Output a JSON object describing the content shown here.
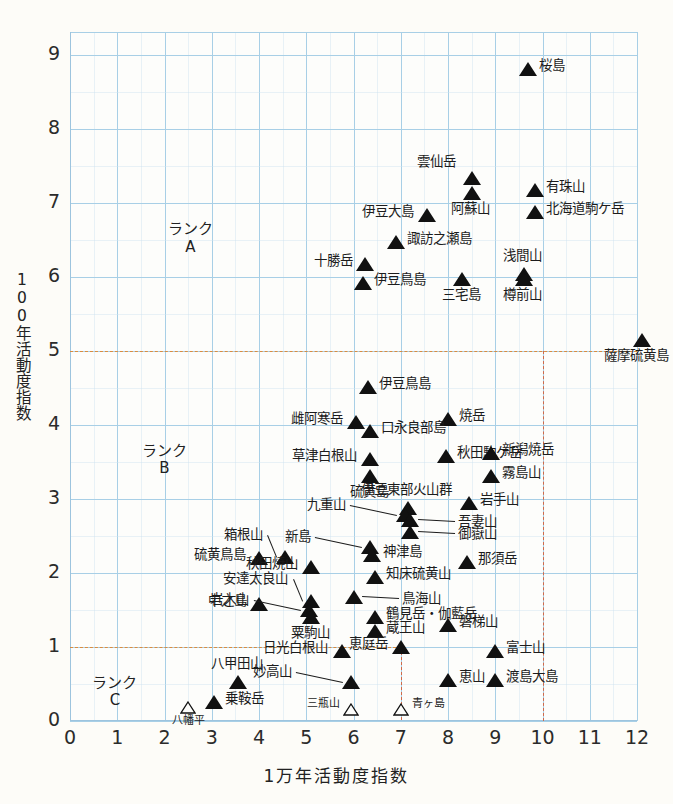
{
  "chart_data": {
    "type": "scatter",
    "title": "",
    "xlabel": "1万年活動度指数",
    "ylabel": "100年活動度指数",
    "xlim": [
      0,
      12.6
    ],
    "ylim": [
      0,
      9.4
    ],
    "xticks": [
      "0",
      "1",
      "2",
      "3",
      "4",
      "5",
      "6",
      "7",
      "8",
      "9",
      "10",
      "11",
      "12"
    ],
    "yticks": [
      "0",
      "1",
      "2",
      "3",
      "4",
      "5",
      "6",
      "7",
      "8",
      "9"
    ],
    "grid": true,
    "legend": "none",
    "rank_thresholds": {
      "rank_a_y": 5,
      "rank_b_y": 1,
      "rank_b_x": 7,
      "rank_c_x": 7,
      "line_color_horizontal": "#d98c40",
      "line_color_vertical": "#cf6a4a"
    },
    "annotations": [
      {
        "text": "ランク\nA",
        "x": 2.55,
        "y": 6.62
      },
      {
        "text": "ランク\nB",
        "x": 2.0,
        "y": 3.62
      },
      {
        "text": "ランク\nC",
        "x": 0.95,
        "y": 0.48
      }
    ],
    "marker_styles": {
      "filled": "filled-triangle",
      "open": "open-triangle"
    },
    "points": [
      {
        "name": "桜島",
        "x": 9.7,
        "y": 8.72,
        "marker": "filled",
        "label_pos": "right"
      },
      {
        "name": "雲仙岳",
        "x": 8.5,
        "y": 7.25,
        "marker": "filled",
        "label_pos": "upleft"
      },
      {
        "name": "阿蘇山",
        "x": 8.5,
        "y": 7.05,
        "marker": "filled",
        "label_pos": "below"
      },
      {
        "name": "有珠山",
        "x": 9.85,
        "y": 7.08,
        "marker": "filled",
        "label_pos": "right"
      },
      {
        "name": "北海道駒ケ岳",
        "x": 9.85,
        "y": 6.78,
        "marker": "filled",
        "label_pos": "right"
      },
      {
        "name": "伊豆大島",
        "x": 7.55,
        "y": 6.75,
        "marker": "filled",
        "label_pos": "left"
      },
      {
        "name": "諏訪之瀬島",
        "x": 6.9,
        "y": 6.38,
        "marker": "filled",
        "label_pos": "right"
      },
      {
        "name": "十勝岳",
        "x": 6.25,
        "y": 6.08,
        "marker": "filled",
        "label_pos": "left"
      },
      {
        "name": "浅間山",
        "x": 9.6,
        "y": 5.95,
        "marker": "filled",
        "label_pos": "above"
      },
      {
        "name": "伊豆鳥島",
        "x": 6.2,
        "y": 5.82,
        "marker": "filled",
        "label_pos": "right"
      },
      {
        "name": "三宅島",
        "x": 8.3,
        "y": 5.88,
        "marker": "filled",
        "label_pos": "below"
      },
      {
        "name": "樽前山",
        "x": 9.6,
        "y": 5.88,
        "marker": "filled",
        "label_pos": "below"
      },
      {
        "name": "薩摩硫黄島",
        "x": 12.1,
        "y": 5.05,
        "marker": "filled",
        "label_pos": "below"
      },
      {
        "name": "伊豆鳥島",
        "x": 6.3,
        "y": 4.42,
        "marker": "filled",
        "label_pos": "right"
      },
      {
        "name": "雌阿寒岳",
        "x": 6.05,
        "y": 3.95,
        "marker": "filled",
        "label_pos": "left"
      },
      {
        "name": "焼岳",
        "x": 8.0,
        "y": 3.98,
        "marker": "filled",
        "label_pos": "right"
      },
      {
        "name": "口永良部島",
        "x": 6.35,
        "y": 3.82,
        "marker": "filled",
        "label_pos": "right"
      },
      {
        "name": "草津白根山",
        "x": 6.35,
        "y": 3.45,
        "marker": "filled",
        "label_pos": "left"
      },
      {
        "name": "秋田駒ケ岳",
        "x": 7.95,
        "y": 3.48,
        "marker": "filled",
        "label_pos": "right"
      },
      {
        "name": "新潟焼岳",
        "x": 8.9,
        "y": 3.52,
        "marker": "filled",
        "label_pos": "right"
      },
      {
        "name": "硫黄島",
        "x": 6.35,
        "y": 3.22,
        "marker": "filled",
        "label_pos": "below"
      },
      {
        "name": "霧島山",
        "x": 8.9,
        "y": 3.22,
        "marker": "filled",
        "label_pos": "right"
      },
      {
        "name": "伊豆東部火山群",
        "x": 7.15,
        "y": 2.78,
        "marker": "filled",
        "label_pos": "above"
      },
      {
        "name": "岩手山",
        "x": 8.45,
        "y": 2.85,
        "marker": "filled",
        "label_pos": "right"
      },
      {
        "name": "九重山",
        "x": 7.1,
        "y": 2.68,
        "marker": "filled",
        "label_pos": "leader-left"
      },
      {
        "name": "吾妻山",
        "x": 7.2,
        "y": 2.62,
        "marker": "filled",
        "label_pos": "leader-right"
      },
      {
        "name": "御嶽山",
        "x": 7.2,
        "y": 2.45,
        "marker": "filled",
        "label_pos": "leader-right"
      },
      {
        "name": "箱根山",
        "x": 4.55,
        "y": 2.12,
        "marker": "filled",
        "label_pos": "leader-up"
      },
      {
        "name": "新島",
        "x": 6.35,
        "y": 2.25,
        "marker": "filled",
        "label_pos": "leader-left"
      },
      {
        "name": "硫黄鳥島",
        "x": 4.0,
        "y": 2.1,
        "marker": "filled",
        "label_pos": "left"
      },
      {
        "name": "秋田焼山",
        "x": 5.1,
        "y": 1.98,
        "marker": "filled",
        "label_pos": "left"
      },
      {
        "name": "神津島",
        "x": 6.4,
        "y": 2.15,
        "marker": "filled",
        "label_pos": "right"
      },
      {
        "name": "那須岳",
        "x": 8.4,
        "y": 2.05,
        "marker": "filled",
        "label_pos": "right"
      },
      {
        "name": "知床硫黄山",
        "x": 6.45,
        "y": 1.85,
        "marker": "filled",
        "label_pos": "right"
      },
      {
        "name": "安達太良山",
        "x": 5.1,
        "y": 1.52,
        "marker": "filled",
        "label_pos": "leader-up"
      },
      {
        "name": "鳥海山",
        "x": 6.0,
        "y": 1.58,
        "marker": "filled",
        "label_pos": "leader-right"
      },
      {
        "name": "中之島",
        "x": 4.0,
        "y": 1.48,
        "marker": "filled",
        "label_pos": "left"
      },
      {
        "name": "岩木山",
        "x": 5.05,
        "y": 1.4,
        "marker": "filled",
        "label_pos": "leader-left"
      },
      {
        "name": "鶴見岳・伽藍岳",
        "x": 6.45,
        "y": 1.3,
        "marker": "filled",
        "label_pos": "right"
      },
      {
        "name": "粟駒山",
        "x": 5.1,
        "y": 1.3,
        "marker": "filled",
        "label_pos": "below"
      },
      {
        "name": "蔵王山",
        "x": 6.45,
        "y": 1.12,
        "marker": "filled",
        "label_pos": "right"
      },
      {
        "name": "磐梯山",
        "x": 8.0,
        "y": 1.2,
        "marker": "filled",
        "label_pos": "right"
      },
      {
        "name": "日光白根山",
        "x": 5.75,
        "y": 0.85,
        "marker": "filled",
        "label_pos": "left"
      },
      {
        "name": "恵庭岳",
        "x": 7.0,
        "y": 0.9,
        "marker": "filled",
        "label_pos": "left"
      },
      {
        "name": "富士山",
        "x": 9.0,
        "y": 0.85,
        "marker": "filled",
        "label_pos": "right"
      },
      {
        "name": "八甲田山",
        "x": 3.55,
        "y": 0.42,
        "marker": "filled",
        "label_pos": "above"
      },
      {
        "name": "妙高山",
        "x": 5.95,
        "y": 0.42,
        "marker": "filled",
        "label_pos": "leader-left"
      },
      {
        "name": "恵山",
        "x": 8.0,
        "y": 0.45,
        "marker": "filled",
        "label_pos": "right"
      },
      {
        "name": "渡島大島",
        "x": 9.0,
        "y": 0.45,
        "marker": "filled",
        "label_pos": "right"
      },
      {
        "name": "乗鞍岳",
        "x": 3.05,
        "y": 0.15,
        "marker": "filled",
        "label_pos": "right"
      },
      {
        "name": "八幡平",
        "x": 2.5,
        "y": 0.1,
        "marker": "open",
        "label_pos": "below"
      },
      {
        "name": "三瓶山",
        "x": 5.95,
        "y": 0.08,
        "marker": "open",
        "label_pos": "left"
      },
      {
        "name": "青ヶ島",
        "x": 7.0,
        "y": 0.08,
        "marker": "open",
        "label_pos": "right"
      }
    ]
  }
}
